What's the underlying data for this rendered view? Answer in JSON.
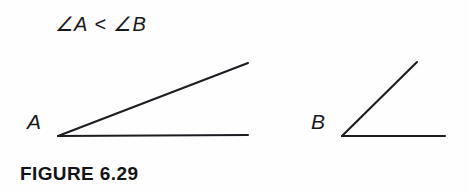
{
  "figure": {
    "background_color": "#fefefe",
    "ink_color": "#1b1d21",
    "expression": "∠A < ∠B",
    "caption": "FIGURE 6.29",
    "angles": [
      {
        "name": "angle-a",
        "label": "A",
        "label_position": {
          "x": 27,
          "y": 111
        },
        "vertex": {
          "x": 58,
          "y": 136
        },
        "rays": [
          {
            "name": "horizontal-ray",
            "end": {
              "x": 248,
              "y": 135
            }
          },
          {
            "name": "slanted-ray",
            "end": {
              "x": 248,
              "y": 63
            }
          }
        ],
        "approx_degrees": 21
      },
      {
        "name": "angle-b",
        "label": "B",
        "label_position": {
          "x": 311,
          "y": 111
        },
        "vertex": {
          "x": 342,
          "y": 136
        },
        "rays": [
          {
            "name": "horizontal-ray",
            "end": {
              "x": 445,
              "y": 136
            }
          },
          {
            "name": "slanted-ray",
            "end": {
              "x": 417,
              "y": 62
            }
          }
        ],
        "approx_degrees": 45
      }
    ]
  }
}
